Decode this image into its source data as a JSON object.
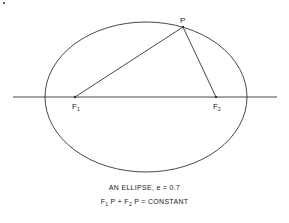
{
  "diagram": {
    "type": "ellipse-foci",
    "ellipse": {
      "cx": 146,
      "cy": 97,
      "rx": 101,
      "ry": 75
    },
    "axis": {
      "x1": 13,
      "x2": 277,
      "y": 97
    },
    "points": {
      "P": {
        "label": "P",
        "x": 183,
        "y": 27
      },
      "F1": {
        "label": "F",
        "sub": "1",
        "x": 75,
        "y": 97
      },
      "F2": {
        "label": "F",
        "sub": "2",
        "x": 216,
        "y": 97
      }
    },
    "caption": {
      "line1": "AN ELLIPSE, e = 0.7",
      "line2_parts": [
        "F",
        "1",
        " P + F",
        "2",
        " P = CONSTANT"
      ]
    },
    "eccentricity": 0.7,
    "stroke_color": "#333333"
  }
}
